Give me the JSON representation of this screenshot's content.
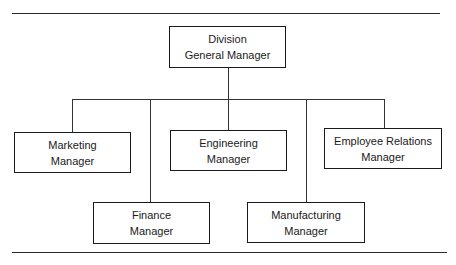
{
  "chart": {
    "type": "organization-chart",
    "root": {
      "line1": "Division",
      "line2": "General Manager"
    },
    "children": [
      {
        "id": "marketing",
        "line1": "Marketing",
        "line2": "Manager"
      },
      {
        "id": "finance",
        "line1": "Finance",
        "line2": "Manager"
      },
      {
        "id": "engineering",
        "line1": "Engineering",
        "line2": "Manager"
      },
      {
        "id": "manufacturing",
        "line1": "Manufacturing",
        "line2": "Manager"
      },
      {
        "id": "employee-relations",
        "line1": "Employee Relations",
        "line2": "Manager"
      }
    ]
  },
  "colors": {
    "line": "#333333",
    "border": "#1a1a1a",
    "background": "#ffffff"
  }
}
